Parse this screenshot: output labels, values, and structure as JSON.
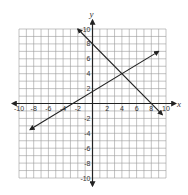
{
  "chart_data": {
    "type": "line",
    "title": "",
    "xlabel": "x",
    "ylabel": "y",
    "xlim": [
      -10,
      10
    ],
    "ylim": [
      -10,
      10
    ],
    "grid": true,
    "grid_step": 1,
    "x_tick_labels": [
      "-10",
      "-8",
      "-6",
      "-4",
      "-2",
      "2",
      "4",
      "6",
      "8",
      "10"
    ],
    "y_tick_labels": [
      "10",
      "8",
      "6",
      "4",
      "2",
      "-2",
      "-4",
      "-6",
      "-8",
      "-10"
    ],
    "series": [
      {
        "name": "line-decreasing",
        "equation": "y = -x + 8",
        "slope": -1,
        "intercept": 8,
        "x": [
          -2,
          9.5
        ],
        "y": [
          10,
          -1.5
        ],
        "arrows": "both",
        "fit_confidence": "high"
      },
      {
        "name": "line-increasing",
        "equation": "y ≈ 0.6x + 1.6 (estimated)",
        "slope": 0.6,
        "intercept": 1.6,
        "x": [
          -8.5,
          9
        ],
        "y": [
          -3.5,
          7
        ],
        "arrows": "both",
        "fit_confidence": "low"
      }
    ],
    "intersection": {
      "x": 4,
      "y": 4
    }
  },
  "colors": {
    "grid": "#9a9a9a",
    "axis": "#222222",
    "line": "#222222",
    "text": "#333333"
  }
}
